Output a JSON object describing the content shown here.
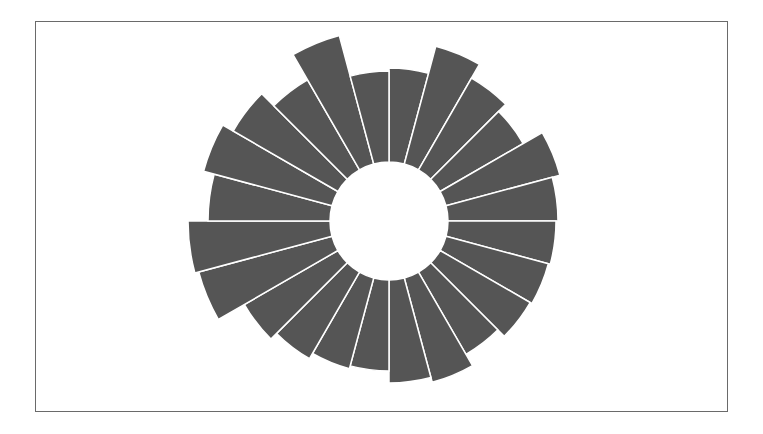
{
  "chart_data": {
    "type": "bar",
    "subtype": "radial-bar",
    "title": "",
    "xlabel": "",
    "ylabel": "",
    "grid": false,
    "legend": null,
    "categories": [
      "1",
      "2",
      "3",
      "4",
      "5",
      "6",
      "7",
      "8",
      "9",
      "10",
      "11",
      "12",
      "13",
      "14",
      "15",
      "16",
      "17",
      "18",
      "19",
      "20",
      "21",
      "22",
      "23",
      "24"
    ],
    "values": [
      153,
      181,
      165,
      155,
      177,
      169,
      167,
      165,
      163,
      154,
      167,
      162,
      150,
      153,
      159,
      167,
      197,
      201,
      181,
      192,
      180,
      163,
      192,
      150
    ],
    "inner_radius": 59,
    "start_angle_deg": 0,
    "direction": "clockwise",
    "bar_color": "#555555",
    "separator_color": "#ffffff"
  },
  "layout": {
    "center_x": 389,
    "center_y": 221,
    "frame_border_color": "#6a6a6a"
  }
}
